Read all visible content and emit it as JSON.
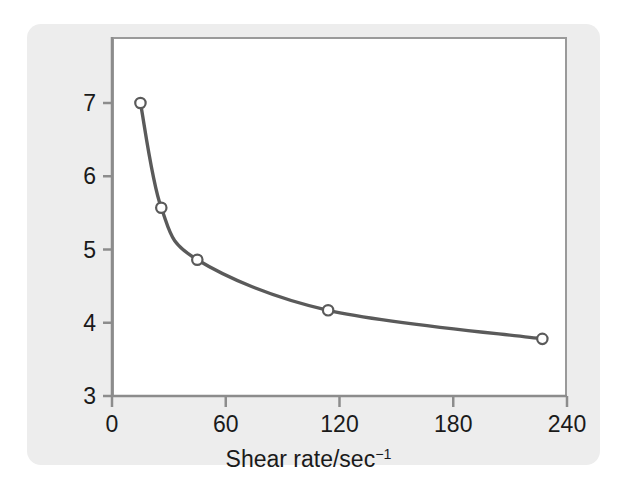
{
  "chart_data": {
    "type": "line",
    "title": "",
    "subtitle": "",
    "xlabel": "Shear rate/sec−1",
    "xlabel_base": "Shear rate/sec",
    "xlabel_exponent": "−1",
    "ylabel": "Viscosity (cp)",
    "xlim": [
      0,
      240
    ],
    "ylim": [
      3,
      7.7
    ],
    "xticks": [
      0,
      60,
      120,
      180,
      240
    ],
    "xtick_labels": [
      "0",
      "60",
      "120",
      "180",
      "240"
    ],
    "yticks": [
      3,
      4,
      5,
      6,
      7
    ],
    "ytick_labels": [
      "3",
      "4",
      "5",
      "6",
      "7"
    ],
    "grid": false,
    "legend": false,
    "legend_position": "none",
    "x": [
      15,
      26,
      45,
      114,
      227
    ],
    "y": [
      7.0,
      5.57,
      4.86,
      4.17,
      3.78
    ],
    "series": [
      {
        "name": "Viscosity",
        "marker": "open-circle",
        "line_color": "#5a5a5a",
        "marker_face_color": "#ffffff",
        "marker_edge_color": "#5a5a5a",
        "points": [
          {
            "x": 15,
            "y": 7.0
          },
          {
            "x": 26,
            "y": 5.57
          },
          {
            "x": 45,
            "y": 4.86
          },
          {
            "x": 114,
            "y": 4.17
          },
          {
            "x": 227,
            "y": 3.78
          }
        ]
      }
    ],
    "annotations": []
  },
  "colors": {
    "card_background": "#ededed",
    "panel_background": "#ffffff",
    "frame": "#9a9a9a",
    "axis": "#8c8c8c",
    "curve": "#5a5a5a",
    "text": "#1a1a1a"
  }
}
